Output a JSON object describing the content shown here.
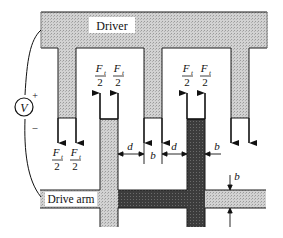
{
  "diagram": {
    "type": "comb-drive electrostatic actuator schematic",
    "labels": {
      "driver": "Driver",
      "drive_arm": "Drive arm",
      "voltage_source": "V",
      "plus": "+",
      "minus": "–",
      "force_numerator": "F",
      "force_subscript": "t",
      "force_denominator": "2",
      "gap_label": "d",
      "width_label": "b"
    },
    "colors": {
      "driver_fill": "#c8c8c8",
      "arm_light_fill": "#c4c4c4",
      "arm_dark_fill": "#3a3a3a",
      "outline": "#1a1a1a",
      "background": "#ffffff"
    },
    "elements": {
      "driver_fingers": 3,
      "arm_fingers": 2,
      "force_labels": 6,
      "dimension_callouts": [
        "d",
        "b",
        "d",
        "b",
        "b"
      ]
    }
  }
}
